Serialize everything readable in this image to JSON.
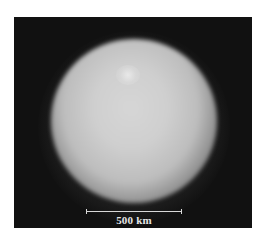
{
  "image": {
    "subject": "planetary-body-disk",
    "background_color": "#111111",
    "disk_color": "#cfcfcf"
  },
  "scale_bar": {
    "label": "500 km"
  }
}
